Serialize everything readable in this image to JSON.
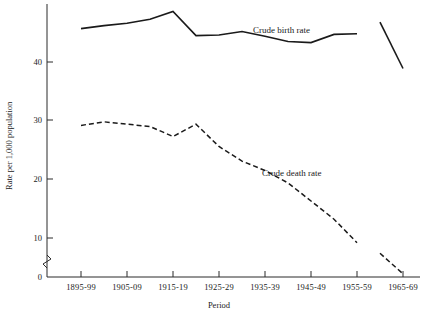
{
  "chart_data": {
    "type": "line",
    "title": "",
    "xlabel": "Period",
    "ylabel": "Rate per 1,000 population",
    "ylim": [
      0,
      50
    ],
    "yticks": [
      0,
      10,
      20,
      30,
      40
    ],
    "ytick_labels": [
      "0",
      "10",
      "20",
      "30",
      "40"
    ],
    "y_axis_break": true,
    "grid": false,
    "legend_position": "inline-annotation",
    "categories": [
      "1895-99",
      "1900-04",
      "1905-09",
      "1910-14",
      "1915-19",
      "1920-24",
      "1925-29",
      "1930-34",
      "1935-39",
      "1940-44",
      "1945-49",
      "1950-54",
      "1955-59",
      "1960-64",
      "1965-69"
    ],
    "xtick_labels": [
      "1895-99",
      "1905-09",
      "1915-19",
      "1925-29",
      "1935-39",
      "1945-49",
      "1955-59",
      "1965-69"
    ],
    "series": [
      {
        "name": "Crude birth rate",
        "style": "solid",
        "values": [
          45.7,
          46.2,
          46.6,
          47.3,
          48.6,
          44.5,
          44.6,
          45.2,
          44.4,
          43.5,
          43.3,
          44.7,
          44.8,
          46.8,
          38.9
        ],
        "break_after_index": 12
      },
      {
        "name": "Crude death rate",
        "style": "dashed",
        "values": [
          29.2,
          29.8,
          29.4,
          29.0,
          27.3,
          29.4,
          25.6,
          23.1,
          21.5,
          19.4,
          16.3,
          13.2,
          9.2,
          7.4,
          3.9
        ],
        "break_after_index": 12
      }
    ],
    "annotations": [
      {
        "text": "Crude birth rate",
        "x": "1935-39",
        "y": 47.5
      },
      {
        "text": "Crude death rate",
        "x": "1940-44",
        "y": 22.5
      }
    ]
  }
}
